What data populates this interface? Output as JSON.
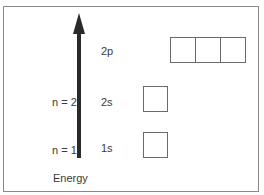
{
  "diagram": {
    "type": "orbital-energy-diagram",
    "axis": {
      "label": "Energy",
      "direction": "up"
    },
    "levels": [
      {
        "n_label": "n = 1",
        "orbital": "1s",
        "boxes": 1
      },
      {
        "n_label": "n = 2",
        "orbital": "2s",
        "boxes": 1
      },
      {
        "n_label": "",
        "orbital": "2p",
        "boxes": 3
      }
    ],
    "colors": {
      "arrow": "#2a2a2a",
      "box_border": "#6a6a6a",
      "frame": "#8a8a8a"
    }
  }
}
